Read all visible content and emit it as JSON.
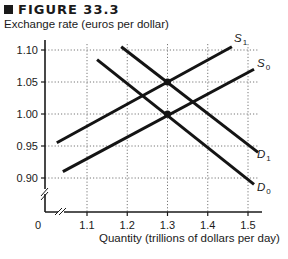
{
  "figure": {
    "title": "FIGURE 33.3",
    "ylabel": "Exchange rate (euros per dollar)",
    "xlabel": "Quantity (trillions of dollars per day)",
    "origin_label": "0"
  },
  "chart_data": {
    "type": "line",
    "title": "FIGURE 33.3",
    "xlabel": "Quantity (trillions of dollars per day)",
    "ylabel": "Exchange rate (euros per dollar)",
    "xlim": [
      1.0,
      1.55
    ],
    "ylim": [
      0.85,
      1.12
    ],
    "x_ticks": [
      "1.1",
      "1.2",
      "1.3",
      "1.4",
      "1.5"
    ],
    "y_ticks": [
      "0.90",
      "0.95",
      "1.00",
      "1.05",
      "1.10"
    ],
    "grid": true,
    "axis_breaks": [
      "x",
      "y"
    ],
    "series": [
      {
        "name": "S1",
        "label_main": "S",
        "label_sub": "1",
        "kind": "supply",
        "points": [
          [
            1.025,
            0.955
          ],
          [
            1.46,
            1.105
          ]
        ]
      },
      {
        "name": "S0",
        "label_main": "S",
        "label_sub": "0",
        "kind": "supply",
        "points": [
          [
            1.04,
            0.91
          ],
          [
            1.515,
            1.07
          ]
        ]
      },
      {
        "name": "D1",
        "label_main": "D",
        "label_sub": "1",
        "kind": "demand",
        "points": [
          [
            1.185,
            1.105
          ],
          [
            1.525,
            0.94
          ]
        ]
      },
      {
        "name": "D0",
        "label_main": "D",
        "label_sub": "0",
        "kind": "demand",
        "points": [
          [
            1.125,
            1.085
          ],
          [
            1.515,
            0.89
          ]
        ]
      }
    ],
    "equilibria": [
      {
        "label": "S1/D1",
        "x": 1.3,
        "y": 1.05
      },
      {
        "label": "S0/D0",
        "x": 1.3,
        "y": 1.0
      }
    ]
  }
}
